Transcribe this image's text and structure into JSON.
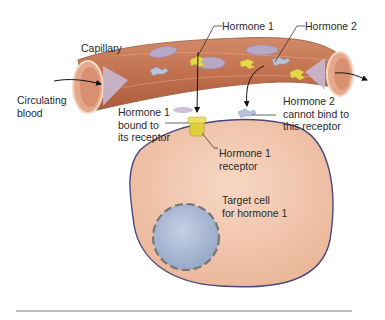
{
  "figure": {
    "labels": {
      "capillary": "Capillary",
      "circulating_blood": "Circulating\nblood",
      "hormone1": "Hormone 1",
      "hormone2": "Hormone 2",
      "hormone1_bound": "Hormone 1\nbound to\nits receptor",
      "hormone2_cannot_bind": "Hormone 2\ncannot bind to\nthis receptor",
      "hormone1_receptor": "Hormone 1\nreceptor",
      "target_cell": "Target cell\nfor hormone 1"
    },
    "colors": {
      "capillary_wall": "#c8785a",
      "capillary_inner": "#e8b49a",
      "cell_fill": "#f2c9b2",
      "cell_outline": "#4a4a7a",
      "nucleus_fill": "#aab8d4",
      "nucleus_outline": "#777777",
      "hormone1": "#e6d84a",
      "hormone2": "#b8c4dc",
      "rbc": "#b8a8c8",
      "rule": "#aaaaaa"
    }
  }
}
